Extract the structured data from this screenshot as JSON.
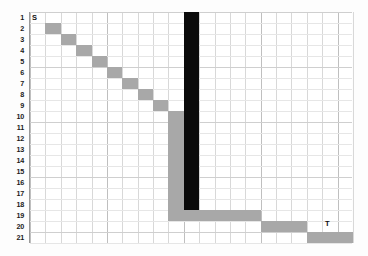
{
  "figure": {
    "type": "grid-path-diagram",
    "background_color": "#ffffff",
    "grid_line_color": "#d8d8d8",
    "path_color": "#a8a8a8",
    "blocked_color": "#0b0b0b",
    "label_color": "#111111"
  },
  "axes": {
    "rows": 21,
    "columns": 21,
    "row_labels": [
      "1",
      "2",
      "3",
      "4",
      "5",
      "6",
      "7",
      "8",
      "9",
      "10",
      "11",
      "12",
      "13",
      "14",
      "15",
      "16",
      "17",
      "18",
      "19",
      "20",
      "21"
    ]
  },
  "endpoints": {
    "start": {
      "label": "S",
      "row": 1,
      "column": 1
    },
    "target": {
      "label": "T",
      "row": 21,
      "column": 21
    }
  },
  "chart_data": {
    "type": "heatmap",
    "title": "",
    "xlabel": "",
    "ylabel": "",
    "grid": true,
    "legend": "",
    "rows": 21,
    "columns": 21,
    "cells": [
      {
        "name": "diagonal-cell-r2",
        "row": 2,
        "col": 2,
        "color": "#a8a8a8",
        "kind": "path"
      },
      {
        "name": "diagonal-cell-r3",
        "row": 3,
        "col": 3,
        "color": "#a8a8a8",
        "kind": "path"
      },
      {
        "name": "diagonal-cell-r4",
        "row": 4,
        "col": 4,
        "color": "#a8a8a8",
        "kind": "path"
      },
      {
        "name": "diagonal-cell-r5",
        "row": 5,
        "col": 5,
        "color": "#a8a8a8",
        "kind": "path"
      },
      {
        "name": "diagonal-cell-r6",
        "row": 6,
        "col": 6,
        "color": "#a8a8a8",
        "kind": "path"
      },
      {
        "name": "diagonal-cell-r7",
        "row": 7,
        "col": 7,
        "color": "#a8a8a8",
        "kind": "path"
      },
      {
        "name": "diagonal-cell-r8",
        "row": 8,
        "col": 8,
        "color": "#a8a8a8",
        "kind": "path"
      },
      {
        "name": "diagonal-cell-r9",
        "row": 9,
        "col": 9,
        "color": "#a8a8a8",
        "kind": "path"
      },
      {
        "name": "vertical-path-segment",
        "row_start": 10,
        "row_end": 18,
        "col": 10,
        "color": "#a8a8a8",
        "kind": "path"
      },
      {
        "name": "obstacle-bar",
        "row_start": 1,
        "row_end": 18,
        "col": 11,
        "color": "#0b0b0b",
        "kind": "blocked"
      },
      {
        "name": "horizontal-path-segment-row19",
        "row": 19,
        "col_start": 10,
        "col_end": 15,
        "color": "#a8a8a8",
        "kind": "path"
      },
      {
        "name": "horizontal-path-segment-row20",
        "row": 20,
        "col_start": 16,
        "col_end": 18,
        "color": "#a8a8a8",
        "kind": "path"
      },
      {
        "name": "horizontal-path-segment-row21",
        "row": 21,
        "col_start": 19,
        "col_end": 21,
        "color": "#a8a8a8",
        "kind": "path"
      }
    ]
  }
}
